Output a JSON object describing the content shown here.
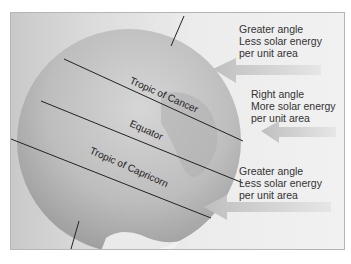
{
  "diagram": {
    "globe_lines": [
      {
        "name": "tropic-of-cancer",
        "label": "Tropic of Cancer"
      },
      {
        "name": "equator",
        "label": "Equator"
      },
      {
        "name": "tropic-of-capricorn",
        "label": "Tropic of Capricorn"
      }
    ],
    "annotations": [
      {
        "line1": "Greater angle",
        "line2": "Less solar energy",
        "line3": "per unit area"
      },
      {
        "line1": "Right angle",
        "line2": "More solar energy",
        "line3": "per unit area"
      },
      {
        "line1": "Greater angle",
        "line2": "Less solar energy",
        "line3": "per unit area"
      }
    ],
    "colors": {
      "frame_border": "#b5b5b5",
      "arrow": "#c8c8c8",
      "line": "#222222",
      "text": "#333333"
    }
  }
}
